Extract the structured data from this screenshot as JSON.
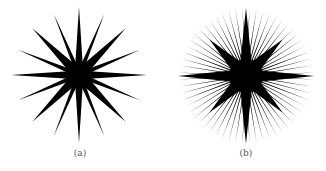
{
  "figures": [
    {
      "id": "a",
      "caption": "(a)",
      "center": [
        79,
        75
      ],
      "color": "#000000",
      "main_spikes": {
        "count": 4,
        "offset_deg": 0,
        "length": 68,
        "half_width_deg": 9,
        "base_radius": 11
      },
      "diagonal_spikes": {
        "count": 4,
        "offset_deg": 45,
        "length": 66,
        "half_width_deg": 10,
        "base_radius": 12
      },
      "thin_spikes": {
        "count": 8,
        "offset_deg": 22.5,
        "length": 66,
        "half_width_deg": 4.5,
        "base_radius": 12
      },
      "ray_lines": null
    },
    {
      "id": "b",
      "caption": "(b)",
      "center": [
        246,
        76
      ],
      "color": "#000000",
      "main_spikes": {
        "count": 4,
        "offset_deg": 0,
        "length": 68,
        "half_width_deg": 11,
        "base_radius": 14
      },
      "diagonal_spikes": {
        "count": 4,
        "offset_deg": 45,
        "length": 52,
        "half_width_deg": 12,
        "base_radius": 14
      },
      "thin_spikes": null,
      "ray_lines": {
        "count": 60,
        "offset_deg": 3,
        "length": 68,
        "width": 1.1
      }
    }
  ]
}
